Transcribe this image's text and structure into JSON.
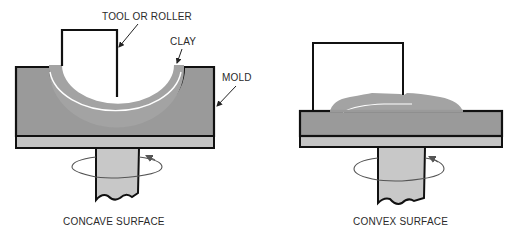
{
  "figure": {
    "left_panel": {
      "caption": "CONCAVE SURFACE",
      "labels": {
        "tool": "TOOL OR ROLLER",
        "clay": "CLAY",
        "mold": "MOLD"
      }
    },
    "right_panel": {
      "caption": "CONVEX SURFACE"
    }
  },
  "colors": {
    "outline": "#111111",
    "mold": "#9a9a9a",
    "clay": "#a3a3a3",
    "plate": "#c4c4c4",
    "shaft": "#c8c8c8",
    "highlight": "#ffffff",
    "arrow": "#555555"
  }
}
